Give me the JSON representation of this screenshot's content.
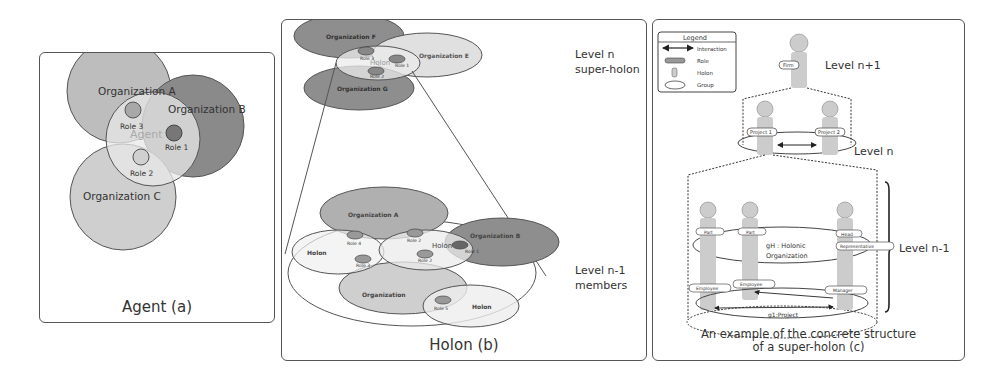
{
  "panel_a": {
    "caption": "Agent (a)",
    "organizations": [
      "Organization A",
      "Organization B",
      "Organization C"
    ],
    "agent_label": "Agent",
    "roles": [
      "Role 1",
      "Role 2",
      "Role 3"
    ]
  },
  "panel_b": {
    "caption": "Holon (b)",
    "level_top": [
      "Level n",
      "super-holon"
    ],
    "level_bottom": [
      "Level n-1",
      "members"
    ],
    "top_organizations": [
      "Organization F",
      "Organization E",
      "Organization G"
    ],
    "top_holon_label": "Holon",
    "top_roles": [
      "Role 3",
      "Role 1",
      "Role 2"
    ],
    "bottom_organizations": [
      "Organization A",
      "Organization B",
      "Organization"
    ],
    "bottom_holons": [
      "Holon",
      "Holon",
      "Holon"
    ],
    "bottom_roles": [
      "Role 4",
      "Role 2",
      "Role 1",
      "Role 3",
      "Role 2",
      "Role 5"
    ]
  },
  "panel_c": {
    "caption_line1": "An example of the concrete structure",
    "caption_line2": "of a super-holon (c)",
    "legend": {
      "title": "Legend",
      "items": [
        "Interaction",
        "Role",
        "Holon",
        "Group"
      ]
    },
    "levels": [
      "Level n+1",
      "Level n",
      "Level n-1"
    ],
    "roles": {
      "firm": "Firm",
      "project1": "Project 1",
      "project2": "Project 2",
      "part1": "Part",
      "part2": "Part",
      "head": "Head",
      "representative": "Representative",
      "employee1": "Employee",
      "employee2": "Employee",
      "manager": "Manager"
    },
    "groups": {
      "holonic": [
        "gH : Holonic",
        "Organization"
      ],
      "project": "g1:Project"
    }
  }
}
